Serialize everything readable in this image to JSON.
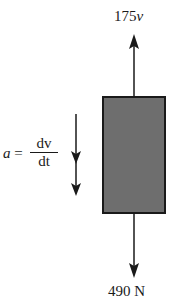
{
  "diagram": {
    "upward_force": {
      "label_coeff": "175",
      "label_var": "v"
    },
    "downward_force": {
      "label": "490 N"
    },
    "acceleration": {
      "symbol": "a",
      "equals": "=",
      "numerator": "dv",
      "denominator": "dt"
    },
    "body": {
      "fill": "#6e6e6e",
      "stroke": "#1a1a1a"
    }
  }
}
